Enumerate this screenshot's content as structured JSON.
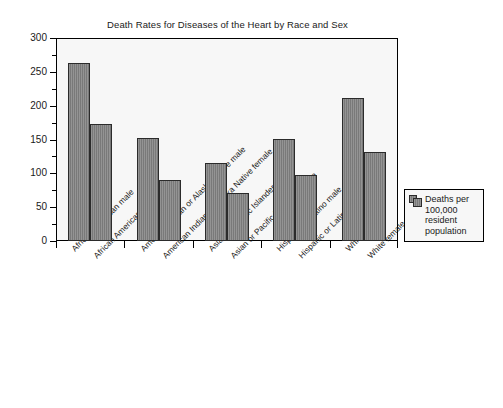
{
  "chart_data": {
    "type": "bar",
    "title": "Death Rates for Diseases of the Heart by Race and Sex",
    "xlabel": "",
    "ylabel": "",
    "ylim": [
      0,
      300
    ],
    "y_ticks": [
      0,
      50,
      100,
      150,
      200,
      250,
      300
    ],
    "y_minor_ticks": [
      25,
      75,
      125,
      175,
      225,
      275
    ],
    "grid": false,
    "legend_position": "right",
    "legend_entries": [
      "Deaths per 100,000 resident population"
    ],
    "categories": [
      "African American male",
      "African American female",
      "American Indian or Alaska Native male",
      "American Indian or Alaska Native female",
      "Asian or Pacific Islander male",
      "Asian or Pacific Islander female",
      "Hispanic or Latino male",
      "Hispanic or Latino female",
      "White male",
      "White female"
    ],
    "values": [
      263,
      173,
      152,
      90,
      116,
      71,
      151,
      98,
      212,
      131
    ],
    "series": [
      {
        "name": "Deaths per 100,000 resident population",
        "values": [
          263,
          173,
          152,
          90,
          116,
          71,
          151,
          98,
          212,
          131
        ]
      }
    ],
    "bar_color": "#7f7f7f",
    "bar_border_color": "#2b2b2b",
    "plot_background": "#f7f7f7",
    "frame_color": "#000000"
  },
  "legend": {
    "label": "Deaths per\n100,000\nresident\npopulation",
    "swatch_icon": "bar-swatch-icon"
  },
  "axis": {
    "y_tick_labels": [
      "300",
      "250",
      "200",
      "150",
      "100",
      "50",
      "0"
    ]
  }
}
